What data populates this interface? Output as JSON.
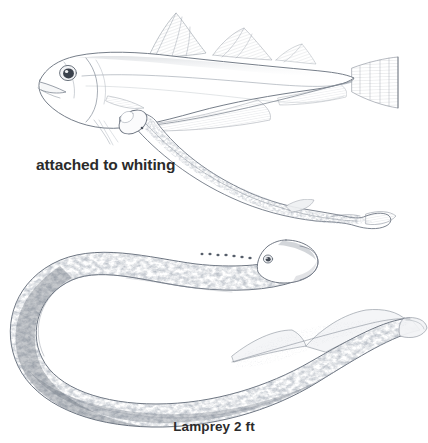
{
  "plate": {
    "background_color": "#ffffff",
    "ink_color": "#5d6470",
    "text_color": "#2b2b2b",
    "medium": "pen-and-ink stipple illustration",
    "figures": [
      {
        "id": "whiting-with-lamprey",
        "name": "whiting",
        "description": "side view of a whiting with a sea lamprey attached to its belly"
      },
      {
        "id": "lamprey-full",
        "name": "lamprey",
        "description": "full-length sea lamprey curved into a C shape, head at upper right"
      }
    ]
  },
  "labels": {
    "attached": "attached to whiting",
    "caption": "Lamprey 2 ft"
  },
  "anatomy": {
    "lamprey_gill_pores": 7,
    "whiting_dorsal_fins": 3,
    "whiting_anal_fins": 2,
    "lamprey_dorsal_fins": 2
  }
}
